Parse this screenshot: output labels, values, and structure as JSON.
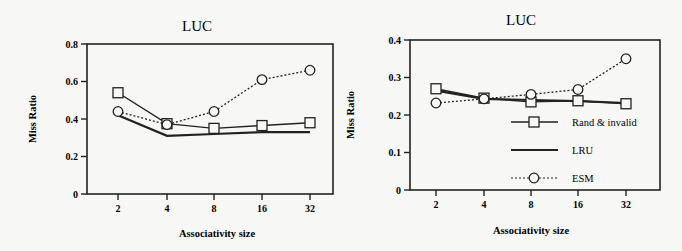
{
  "chart_data": [
    {
      "type": "line",
      "title": "LUC",
      "xlabel": "Associativity size",
      "ylabel": "Miss Ratio",
      "categories": [
        "2",
        "4",
        "8",
        "16",
        "32"
      ],
      "yticks": [
        "0",
        "0.2",
        "0.4",
        "0.6",
        "0.8"
      ],
      "ylim": [
        0,
        0.8
      ],
      "grid": false,
      "legend_position": "none",
      "series": [
        {
          "name": "Rand & invalid",
          "marker": "square",
          "style": "solid",
          "values": [
            0.54,
            0.375,
            0.35,
            0.365,
            0.38
          ]
        },
        {
          "name": "LRU",
          "marker": "none",
          "style": "solid-thick",
          "values": [
            0.42,
            0.31,
            0.32,
            0.33,
            0.33
          ]
        },
        {
          "name": "ESM",
          "marker": "circle",
          "style": "dotted",
          "values": [
            0.44,
            0.37,
            0.44,
            0.61,
            0.66
          ]
        }
      ]
    },
    {
      "type": "line",
      "title": "LUC",
      "xlabel": "Associativity size",
      "ylabel": "Miss Ratio",
      "categories": [
        "2",
        "4",
        "8",
        "16",
        "32"
      ],
      "yticks": [
        "0",
        "0.1",
        "0.2",
        "0.3",
        "0.4"
      ],
      "ylim": [
        0,
        0.4
      ],
      "grid": false,
      "legend_position": "inside-lower-right",
      "series": [
        {
          "name": "Rand & invalid",
          "marker": "square",
          "style": "solid",
          "values": [
            0.27,
            0.245,
            0.235,
            0.238,
            0.23
          ]
        },
        {
          "name": "LRU",
          "marker": "none",
          "style": "solid-thick",
          "values": [
            0.265,
            0.243,
            0.24,
            0.237,
            0.232
          ]
        },
        {
          "name": "ESM",
          "marker": "circle",
          "style": "dotted",
          "values": [
            0.232,
            0.243,
            0.255,
            0.268,
            0.35
          ]
        }
      ]
    }
  ],
  "legend": {
    "items": [
      "Rand & invalid",
      "LRU",
      "ESM"
    ]
  },
  "colors": {
    "line": "#222222",
    "background": "#f7f7f5"
  }
}
